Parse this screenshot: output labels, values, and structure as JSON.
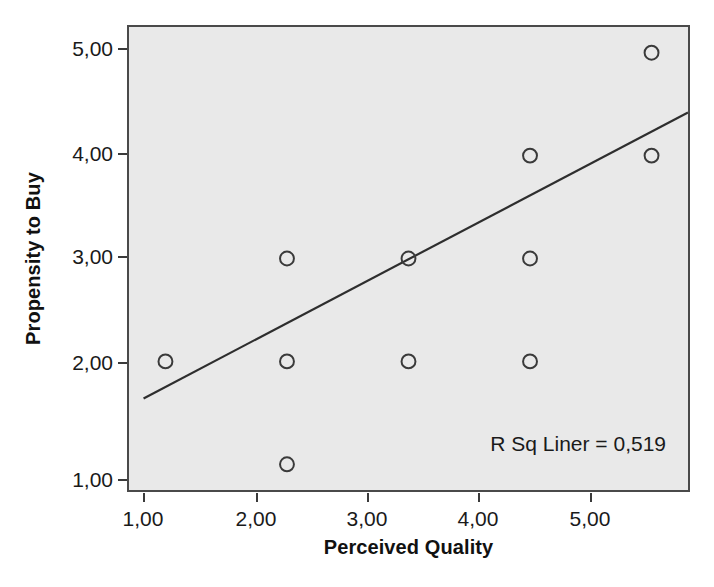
{
  "chart_data": {
    "type": "scatter",
    "title": "",
    "xlabel": "Perceived Quality",
    "ylabel": "Propensity to Buy",
    "xlim": [
      0.7,
      5.3
    ],
    "ylim": [
      0.75,
      5.25
    ],
    "grid": false,
    "legend": null,
    "x_tick_labels": [
      "1,00",
      "2,00",
      "3,00",
      "4,00",
      "5,00"
    ],
    "y_tick_labels": [
      "1,00",
      "2,00",
      "3,00",
      "4,00",
      "5,00"
    ],
    "x_ticks": [
      1,
      2,
      3,
      4,
      5
    ],
    "y_ticks": [
      1,
      2,
      3,
      4,
      5
    ],
    "points": [
      {
        "x": 1,
        "y": 2
      },
      {
        "x": 2,
        "y": 3
      },
      {
        "x": 2,
        "y": 2
      },
      {
        "x": 2,
        "y": 1
      },
      {
        "x": 3,
        "y": 3
      },
      {
        "x": 3,
        "y": 2
      },
      {
        "x": 4,
        "y": 4
      },
      {
        "x": 4,
        "y": 3
      },
      {
        "x": 4,
        "y": 2
      },
      {
        "x": 5,
        "y": 5
      },
      {
        "x": 5,
        "y": 4
      }
    ],
    "fit_line": {
      "kind": "linear",
      "x_start": 0.82,
      "y_start": 1.64,
      "x_end": 5.3,
      "y_end": 4.42
    },
    "annotation": "R Sq Liner = 0,519",
    "r_squared": 0.519,
    "marker": "open-circle",
    "colors": {
      "plot_background": "#e9e9e9",
      "frame": "#4a4a4a",
      "marker": "#3a3a3a",
      "fit_line": "#2e2e2e",
      "text": "#1a1a1a"
    }
  }
}
